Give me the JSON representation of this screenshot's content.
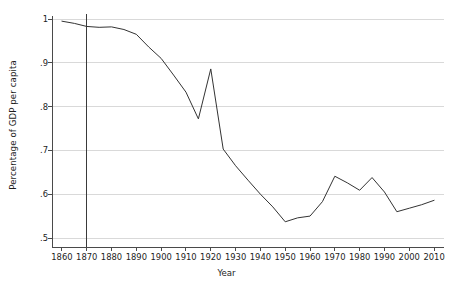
{
  "chart_data": {
    "type": "line",
    "title": "",
    "xlabel": "Year",
    "ylabel": "Percentage of GDP per capita",
    "xlim": [
      1856,
      2014
    ],
    "ylim": [
      0.5,
      1.0
    ],
    "grid": true,
    "grid_axis": "y",
    "legend": "none",
    "xticks": [
      1860,
      1870,
      1880,
      1890,
      1900,
      1910,
      1920,
      1930,
      1940,
      1950,
      1960,
      1970,
      1980,
      1990,
      2000,
      2010
    ],
    "xtick_labels": [
      "1860",
      "1870",
      "1880",
      "1890",
      "1900",
      "1910",
      "1920",
      "1930",
      "1940",
      "1950",
      "1960",
      "1970",
      "1980",
      "1990",
      "2000",
      "2010"
    ],
    "yticks": [
      0.5,
      0.6,
      0.7,
      0.8,
      0.9,
      1.0
    ],
    "ytick_labels": [
      ".5",
      ".6",
      ".7",
      ".8",
      ".9",
      "1"
    ],
    "annotations": [
      {
        "type": "vline",
        "x": 1870,
        "label": ""
      }
    ],
    "series": [
      {
        "name": "Percentage of GDP per capita",
        "color": "#333333",
        "x": [
          1860,
          1865,
          1870,
          1875,
          1880,
          1885,
          1890,
          1895,
          1900,
          1905,
          1910,
          1915,
          1920,
          1925,
          1930,
          1935,
          1940,
          1945,
          1950,
          1955,
          1960,
          1965,
          1970,
          1975,
          1980,
          1985,
          1990,
          1995,
          2000,
          2005,
          2010
        ],
        "values": [
          0.995,
          0.99,
          0.983,
          0.981,
          0.982,
          0.976,
          0.965,
          0.936,
          0.91,
          0.872,
          0.833,
          0.772,
          0.886,
          0.703,
          0.665,
          0.632,
          0.6,
          0.571,
          0.537,
          0.546,
          0.55,
          0.583,
          0.641,
          0.626,
          0.609,
          0.638,
          0.605,
          0.56,
          0.568,
          0.576,
          0.586
        ]
      }
    ]
  }
}
